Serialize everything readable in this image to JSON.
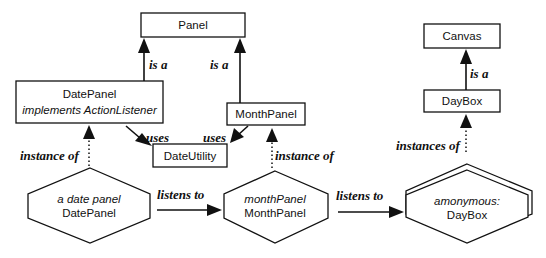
{
  "classes": {
    "panel": {
      "name": "Panel"
    },
    "date_panel": {
      "name": "DatePanel",
      "note": "implements ActionListener"
    },
    "month_panel": {
      "name": "MonthPanel"
    },
    "date_utility": {
      "name": "DateUtility"
    },
    "canvas": {
      "name": "Canvas"
    },
    "day_box": {
      "name": "DayBox"
    }
  },
  "instances": {
    "date_panel_instance": {
      "label": "a date panel",
      "type": "DatePanel"
    },
    "month_panel_instance": {
      "label": "monthPanel",
      "type": "MonthPanel"
    },
    "day_box_instances": {
      "label": "amonymous:",
      "type": "DayBox"
    }
  },
  "relations": {
    "date_panel_is_a": "is a",
    "month_panel_is_a": "is a",
    "day_box_is_a": "is a",
    "date_panel_uses": "uses",
    "month_panel_uses": "uses",
    "date_panel_instance_of": "instance of",
    "month_panel_instance_of": "instance of",
    "day_box_instances_of": "instances of",
    "date_to_month_listens": "listens to",
    "month_to_daybox_listens": "listens to"
  }
}
